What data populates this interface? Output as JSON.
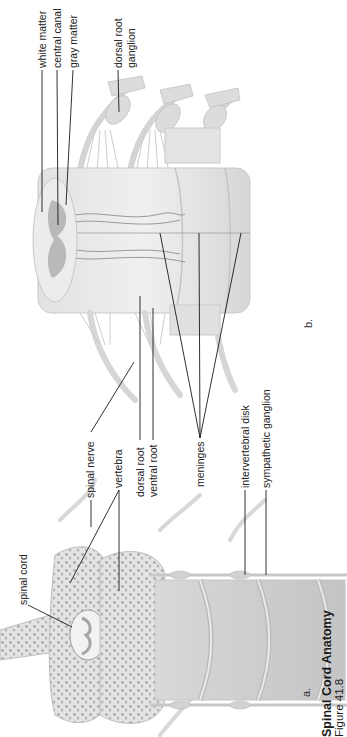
{
  "figure": {
    "title": "Spinal Cord Anatomy",
    "subtitle": "Figure 41.8",
    "orientation": "rotated 90° counter-clockwise",
    "panels": [
      {
        "id": "a",
        "label": "a.",
        "description": "Vertebral column with spinal cord cross-section"
      },
      {
        "id": "b",
        "label": "b.",
        "description": "Spinal cord segment with nerve roots and meninges"
      }
    ]
  },
  "labels": {
    "white_matter": "white matter",
    "central_canal": "central canal",
    "gray_matter": "gray matter",
    "dorsal_root_ganglion_1": "dorsal root",
    "dorsal_root_ganglion_2": "ganglion",
    "spinal_nerve": "spinal nerve",
    "vertebra": "vertebra",
    "dorsal_root": "dorsal root",
    "ventral_root": "ventral root",
    "meninges": "meninges",
    "intervertebral_disk": "intervertebral disk",
    "sympathetic_ganglion": "sympathetic ganglion",
    "spinal_cord": "spinal cord"
  },
  "colors": {
    "line": "#1a1a1a",
    "tissue_light": "#e6e6e6",
    "tissue_mid": "#cfcfcf",
    "tissue_dark": "#a8a8a8",
    "bone": "#d9d9d9"
  }
}
